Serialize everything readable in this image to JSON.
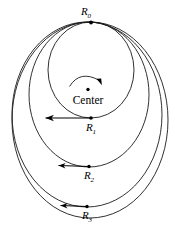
{
  "figure": {
    "background_color": "#ffffff",
    "stroke_color": "#1a1a1a",
    "center": {
      "label": "Center",
      "marker": "center-dot",
      "x": 88,
      "y": 90
    },
    "rotation_arrow": {
      "name": "rotation-arc-arrow",
      "direction": "clockwise"
    },
    "common_point": {
      "label": "R",
      "subscript": "0",
      "x": 91,
      "y": 22
    },
    "orbits": [
      {
        "name": "orbit-1",
        "label": "R",
        "subscript": "1",
        "perigee_x": 91,
        "perigee_y": 118,
        "cx": 91,
        "cy": 70,
        "rx": 43,
        "ry": 48,
        "arrow_from_x": 91,
        "arrow_to_x": 45,
        "arrow_y": 118
      },
      {
        "name": "orbit-2",
        "label": "R",
        "subscript": "2",
        "perigee_x": 89,
        "perigee_y": 167,
        "cx": 89,
        "cy": 94.5,
        "rx": 60,
        "ry": 72.5,
        "arrow_from_x": 89,
        "arrow_to_x": 58,
        "arrow_y": 166
      },
      {
        "name": "orbit-3",
        "label": "R",
        "subscript": "3",
        "perigee_x": 87,
        "perigee_y": 207,
        "cx": 87,
        "cy": 114.5,
        "rx": 75,
        "ry": 92.5,
        "arrow_from_x": 87,
        "arrow_to_x": 60,
        "arrow_y": 206
      },
      {
        "name": "orbit-4",
        "label": "",
        "subscript": "",
        "perigee_x": 90,
        "perigee_y": 218,
        "cx": 90,
        "cy": 120,
        "rx": 78,
        "ry": 98,
        "arrow_from_x": 0,
        "arrow_to_x": 0,
        "arrow_y": 0
      }
    ]
  }
}
